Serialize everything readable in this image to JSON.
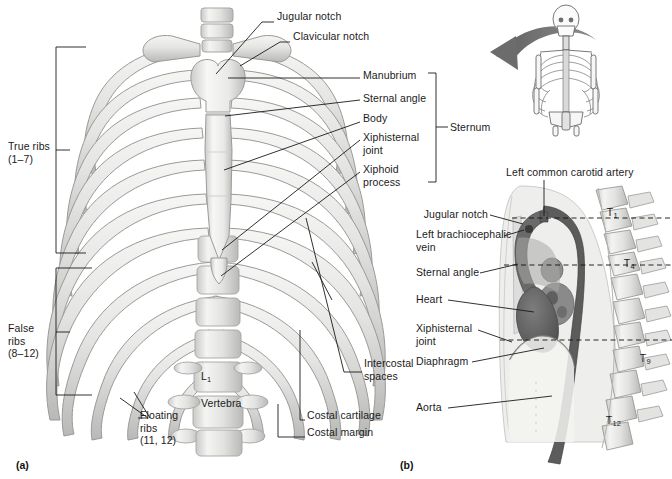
{
  "figure": {
    "panels": [
      {
        "tag": "(a)",
        "caption_x": 16,
        "caption_y": 459
      },
      {
        "tag": "(b)",
        "caption_x": 400,
        "caption_y": 459
      }
    ]
  },
  "panel_a": {
    "left_labels": [
      {
        "id": "true-ribs",
        "text": "True ribs\n(1–7)",
        "x": 8,
        "y": 140
      },
      {
        "id": "false-ribs",
        "text": "False\nribs\n(8–12)",
        "x": 8,
        "y": 322
      }
    ],
    "top_labels": [
      {
        "id": "jugular-notch",
        "text": "Jugular notch",
        "x": 277,
        "y": 10
      },
      {
        "id": "clavicular-notch",
        "text": "Clavicular notch",
        "x": 293,
        "y": 30
      }
    ],
    "right_labels": [
      {
        "id": "manubrium",
        "text": "Manubrium",
        "x": 363,
        "y": 69
      },
      {
        "id": "sternal-angle",
        "text": "Sternal angle",
        "x": 363,
        "y": 92
      },
      {
        "id": "body",
        "text": "Body",
        "x": 363,
        "y": 112
      },
      {
        "id": "xiphisternal-joint",
        "text": "Xiphisternal\njoint",
        "x": 363,
        "y": 131
      },
      {
        "id": "xiphoid-process",
        "text": "Xiphoid\nprocess",
        "x": 363,
        "y": 163
      }
    ],
    "bracket_label": {
      "id": "sternum",
      "text": "Sternum",
      "x": 439,
      "y": 121
    },
    "inner_labels": [
      {
        "id": "l1-vertebra",
        "text": "L",
        "sub": "1",
        "text2": "Vertebra",
        "x": 195,
        "y": 363
      }
    ],
    "bottom_labels": [
      {
        "id": "floating-ribs",
        "text": "Floating\nribs\n(11, 12)",
        "x": 140,
        "y": 409
      },
      {
        "id": "intercostal-spaces",
        "text": "Intercostal\nspaces",
        "x": 364,
        "y": 357
      },
      {
        "id": "costal-cartilage",
        "text": "Costal cartilage",
        "x": 307,
        "y": 415
      },
      {
        "id": "costal-margin",
        "text": "Costal margin",
        "x": 307,
        "y": 432
      }
    ]
  },
  "panel_b": {
    "top_label": {
      "id": "left-common-carotid-artery",
      "text": "Left common carotid artery",
      "x": 506,
      "y": 171
    },
    "left_labels": [
      {
        "id": "jugular-notch-b",
        "text": "Jugular notch",
        "x": 416,
        "y": 211
      },
      {
        "id": "left-brachiocephalic-vein",
        "text": "Left brachiocephalic\nvein",
        "x": 416,
        "y": 232
      },
      {
        "id": "sternal-angle-b",
        "text": "Sternal angle",
        "x": 416,
        "y": 269
      },
      {
        "id": "heart",
        "text": "Heart",
        "x": 416,
        "y": 296
      },
      {
        "id": "xiphisternal-joint-b",
        "text": "Xiphisternal\njoint",
        "x": 416,
        "y": 324
      },
      {
        "id": "diaphragm",
        "text": "Diaphragm",
        "x": 416,
        "y": 358
      },
      {
        "id": "aorta",
        "text": "Aorta",
        "x": 416,
        "y": 404
      }
    ],
    "vertebra_labels": [
      {
        "id": "t1",
        "text": "T",
        "sub": "1",
        "x": 601,
        "y": 199
      },
      {
        "id": "t4",
        "text": "T",
        "sub": "4",
        "x": 618,
        "y": 250
      },
      {
        "id": "t9",
        "text": "T",
        "sub": "9",
        "x": 634,
        "y": 345
      },
      {
        "id": "t12",
        "text": "T",
        "sub": "12",
        "x": 600,
        "y": 407
      }
    ]
  },
  "colors": {
    "ink": "#1b1b1b",
    "bone_light": "#f2f2f0",
    "bone_mid": "#dcdcda",
    "bone_shade": "#bdbdbb",
    "arrow_gray": "#7a7a7a",
    "body_fill": "#ededec",
    "vessel_dark": "#5e5e5e",
    "heart_dark": "#6b6b6b",
    "organ_mid": "#9a9a9a",
    "background": "#ffffff"
  }
}
